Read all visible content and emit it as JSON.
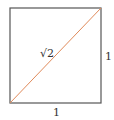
{
  "diagram": {
    "shape": "square",
    "colors": {
      "square_stroke": "#555555",
      "diagonal_stroke": "#e08a5a",
      "label": "#333333",
      "background": "#ffffff"
    },
    "square": {
      "x": 10,
      "y": 8,
      "width": 91,
      "height": 95
    },
    "diagonal": {
      "from": [
        10,
        103
      ],
      "to": [
        101,
        8
      ]
    },
    "labels": {
      "diagonal": "√2",
      "right_side": "1",
      "bottom_side": "1"
    }
  }
}
